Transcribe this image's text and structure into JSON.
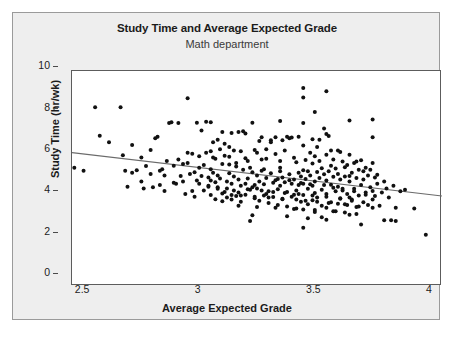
{
  "chart_data": {
    "type": "scatter",
    "title": "Study Time and Average Expected Grade",
    "subtitle": "Math department",
    "xlabel": "Average Expected Grade",
    "ylabel": "Study Time (hr/wk)",
    "xlim": [
      2.4,
      4.0
    ],
    "ylim": [
      0,
      10.4
    ],
    "xticks": [
      2.5,
      3,
      3.5,
      4
    ],
    "xticklabels": [
      "2.5",
      "3",
      "3.5",
      "4"
    ],
    "yticks": [
      0,
      2,
      4,
      6,
      8,
      10
    ],
    "yticklabels": [
      "0",
      "2",
      "4",
      "6",
      "8",
      "10"
    ],
    "grid": false,
    "legend": false,
    "marker_color": "#111111",
    "marker_size": 2.0,
    "trendline": {
      "label": "linear fit",
      "color": "#6b6b6b",
      "x": [
        2.4,
        4.0
      ],
      "y": [
        6.45,
        4.35
      ]
    },
    "points": [
      [
        2.41,
        5.72
      ],
      [
        2.45,
        5.58
      ],
      [
        2.5,
        8.65
      ],
      [
        2.52,
        7.27
      ],
      [
        2.56,
        6.95
      ],
      [
        2.61,
        8.65
      ],
      [
        2.62,
        6.33
      ],
      [
        2.63,
        5.58
      ],
      [
        2.64,
        4.8
      ],
      [
        2.66,
        6.82
      ],
      [
        2.68,
        5.6
      ],
      [
        2.7,
        5.05
      ],
      [
        2.71,
        4.72
      ],
      [
        2.72,
        5.8
      ],
      [
        2.74,
        6.58
      ],
      [
        2.75,
        4.78
      ],
      [
        2.76,
        7.15
      ],
      [
        2.77,
        7.22
      ],
      [
        2.78,
        5.58
      ],
      [
        2.79,
        5.65
      ],
      [
        2.8,
        4.6
      ],
      [
        2.81,
        6.05
      ],
      [
        2.82,
        7.88
      ],
      [
        2.83,
        7.92
      ],
      [
        2.84,
        5.0
      ],
      [
        2.85,
        4.95
      ],
      [
        2.86,
        7.88
      ],
      [
        2.87,
        5.32
      ],
      [
        2.88,
        5.05
      ],
      [
        2.89,
        4.45
      ],
      [
        2.9,
        9.08
      ],
      [
        2.9,
        6.45
      ],
      [
        2.91,
        5.42
      ],
      [
        2.92,
        6.4
      ],
      [
        2.93,
        4.32
      ],
      [
        2.93,
        5.5
      ],
      [
        2.94,
        7.9
      ],
      [
        2.94,
        5.1
      ],
      [
        2.95,
        4.95
      ],
      [
        2.95,
        5.72
      ],
      [
        2.96,
        7.52
      ],
      [
        2.96,
        5.32
      ],
      [
        2.97,
        4.62
      ],
      [
        2.97,
        5.85
      ],
      [
        2.98,
        7.95
      ],
      [
        2.98,
        6.45
      ],
      [
        2.99,
        5.25
      ],
      [
        2.99,
        4.8
      ],
      [
        3.0,
        7.92
      ],
      [
        3.0,
        6.52
      ],
      [
        3.0,
        5.65
      ],
      [
        3.0,
        5.1
      ],
      [
        3.0,
        4.4
      ],
      [
        3.01,
        6.95
      ],
      [
        3.01,
        5.48
      ],
      [
        3.02,
        6.15
      ],
      [
        3.02,
        4.2
      ],
      [
        3.03,
        5.35
      ],
      [
        3.03,
        4.7
      ],
      [
        3.04,
        6.62
      ],
      [
        3.04,
        5.2
      ],
      [
        3.05,
        4.1
      ],
      [
        3.05,
        5.9
      ],
      [
        3.06,
        6.3
      ],
      [
        3.06,
        4.55
      ],
      [
        3.07,
        5.05
      ],
      [
        3.07,
        4.28
      ],
      [
        3.08,
        6.72
      ],
      [
        3.08,
        5.45
      ],
      [
        3.09,
        4.95
      ],
      [
        3.09,
        4.18
      ],
      [
        3.1,
        6.55
      ],
      [
        3.1,
        5.3
      ],
      [
        3.1,
        4.62
      ],
      [
        3.11,
        5.95
      ],
      [
        3.11,
        4.35
      ],
      [
        3.12,
        7.45
      ],
      [
        3.12,
        5.15
      ],
      [
        3.13,
        4.85
      ],
      [
        3.13,
        4.08
      ],
      [
        3.14,
        7.48
      ],
      [
        3.14,
        5.62
      ],
      [
        3.15,
        4.95
      ],
      [
        3.15,
        4.42
      ],
      [
        3.16,
        6.05
      ],
      [
        3.16,
        5.2
      ],
      [
        3.17,
        4.65
      ],
      [
        3.17,
        3.15
      ],
      [
        3.18,
        7.9
      ],
      [
        3.18,
        5.5
      ],
      [
        3.19,
        4.88
      ],
      [
        3.19,
        4.25
      ],
      [
        3.2,
        6.45
      ],
      [
        3.2,
        5.35
      ],
      [
        3.2,
        4.72
      ],
      [
        3.21,
        5.05
      ],
      [
        3.21,
        4.12
      ],
      [
        3.22,
        7.2
      ],
      [
        3.22,
        5.58
      ],
      [
        3.23,
        4.92
      ],
      [
        3.23,
        4.38
      ],
      [
        3.24,
        6.15
      ],
      [
        3.24,
        5.22
      ],
      [
        3.25,
        4.58
      ],
      [
        3.25,
        4.02
      ],
      [
        3.26,
        7.05
      ],
      [
        3.26,
        5.45
      ],
      [
        3.27,
        5.0
      ],
      [
        3.27,
        4.3
      ],
      [
        3.28,
        6.38
      ],
      [
        3.28,
        5.12
      ],
      [
        3.29,
        4.68
      ],
      [
        3.29,
        3.92
      ],
      [
        3.3,
        7.98
      ],
      [
        3.3,
        5.55
      ],
      [
        3.3,
        4.85
      ],
      [
        3.31,
        5.25
      ],
      [
        3.31,
        4.2
      ],
      [
        3.32,
        6.55
      ],
      [
        3.32,
        5.02
      ],
      [
        3.33,
        4.55
      ],
      [
        3.33,
        3.85
      ],
      [
        3.34,
        7.15
      ],
      [
        3.34,
        5.4
      ],
      [
        3.35,
        4.95
      ],
      [
        3.35,
        4.32
      ],
      [
        3.36,
        6.2
      ],
      [
        3.36,
        5.15
      ],
      [
        3.37,
        4.62
      ],
      [
        3.37,
        3.75
      ],
      [
        3.38,
        7.22
      ],
      [
        3.38,
        5.48
      ],
      [
        3.38,
        4.88
      ],
      [
        3.39,
        5.3
      ],
      [
        3.39,
        4.08
      ],
      [
        3.4,
        9.58
      ],
      [
        3.4,
        9.12
      ],
      [
        3.4,
        7.88
      ],
      [
        3.4,
        6.8
      ],
      [
        3.4,
        5.6
      ],
      [
        3.4,
        4.95
      ],
      [
        3.4,
        4.4
      ],
      [
        3.4,
        3.7
      ],
      [
        3.4,
        2.82
      ],
      [
        3.41,
        6.1
      ],
      [
        3.41,
        5.18
      ],
      [
        3.42,
        4.7
      ],
      [
        3.42,
        3.95
      ],
      [
        3.43,
        6.45
      ],
      [
        3.43,
        5.35
      ],
      [
        3.44,
        4.85
      ],
      [
        3.44,
        4.15
      ],
      [
        3.45,
        8.42
      ],
      [
        3.45,
        6.28
      ],
      [
        3.45,
        5.05
      ],
      [
        3.45,
        4.5
      ],
      [
        3.45,
        3.58
      ],
      [
        3.46,
        5.52
      ],
      [
        3.46,
        4.28
      ],
      [
        3.47,
        6.05
      ],
      [
        3.47,
        5.22
      ],
      [
        3.48,
        4.65
      ],
      [
        3.48,
        3.88
      ],
      [
        3.49,
        7.62
      ],
      [
        3.49,
        5.4
      ],
      [
        3.5,
        9.42
      ],
      [
        3.5,
        7.35
      ],
      [
        3.5,
        6.35
      ],
      [
        3.5,
        5.1
      ],
      [
        3.5,
        4.45
      ],
      [
        3.5,
        3.78
      ],
      [
        3.5,
        3.2
      ],
      [
        3.51,
        7.25
      ],
      [
        3.51,
        5.55
      ],
      [
        3.52,
        4.9
      ],
      [
        3.52,
        4.05
      ],
      [
        3.53,
        6.12
      ],
      [
        3.53,
        5.28
      ],
      [
        3.54,
        4.58
      ],
      [
        3.54,
        3.62
      ],
      [
        3.55,
        6.55
      ],
      [
        3.55,
        5.42
      ],
      [
        3.55,
        4.8
      ],
      [
        3.56,
        5.15
      ],
      [
        3.56,
        4.22
      ],
      [
        3.57,
        6.02
      ],
      [
        3.57,
        4.62
      ],
      [
        3.58,
        5.3
      ],
      [
        3.58,
        3.95
      ],
      [
        3.59,
        5.85
      ],
      [
        3.59,
        4.45
      ],
      [
        3.6,
        8.0
      ],
      [
        3.6,
        6.35
      ],
      [
        3.6,
        5.05
      ],
      [
        3.6,
        4.28
      ],
      [
        3.6,
        3.45
      ],
      [
        3.61,
        5.48
      ],
      [
        3.61,
        4.12
      ],
      [
        3.62,
        5.95
      ],
      [
        3.62,
        4.7
      ],
      [
        3.63,
        5.22
      ],
      [
        3.63,
        3.82
      ],
      [
        3.64,
        5.62
      ],
      [
        3.64,
        4.38
      ],
      [
        3.65,
        6.08
      ],
      [
        3.65,
        4.88
      ],
      [
        3.65,
        2.98
      ],
      [
        3.66,
        5.15
      ],
      [
        3.66,
        4.05
      ],
      [
        3.67,
        5.72
      ],
      [
        3.67,
        4.52
      ],
      [
        3.68,
        5.35
      ],
      [
        3.68,
        3.92
      ],
      [
        3.69,
        4.78
      ],
      [
        3.7,
        8.05
      ],
      [
        3.7,
        7.2
      ],
      [
        3.7,
        5.95
      ],
      [
        3.7,
        4.6
      ],
      [
        3.7,
        4.18
      ],
      [
        3.7,
        3.78
      ],
      [
        3.71,
        5.25
      ],
      [
        3.71,
        4.35
      ],
      [
        3.72,
        4.95
      ],
      [
        3.73,
        3.88
      ],
      [
        3.74,
        4.52
      ],
      [
        3.75,
        5.05
      ],
      [
        3.75,
        3.18
      ],
      [
        3.76,
        4.72
      ],
      [
        3.77,
        4.28
      ],
      [
        3.78,
        3.18
      ],
      [
        3.79,
        4.85
      ],
      [
        3.8,
        3.78
      ],
      [
        3.8,
        3.15
      ],
      [
        3.82,
        4.58
      ],
      [
        3.84,
        4.65
      ],
      [
        3.88,
        3.75
      ],
      [
        3.93,
        2.48
      ],
      [
        2.88,
        5.9
      ],
      [
        2.92,
        4.6
      ],
      [
        3.02,
        5.02
      ],
      [
        3.06,
        6.88
      ],
      [
        3.12,
        4.52
      ],
      [
        3.18,
        4.78
      ],
      [
        3.24,
        4.45
      ],
      [
        3.3,
        5.72
      ],
      [
        3.36,
        4.42
      ],
      [
        3.42,
        5.55
      ],
      [
        3.48,
        5.7
      ],
      [
        3.54,
        5.68
      ],
      [
        3.6,
        5.32
      ],
      [
        3.66,
        5.55
      ],
      [
        3.33,
        7.22
      ],
      [
        3.35,
        7.18
      ],
      [
        3.28,
        7.2
      ],
      [
        3.26,
        6.95
      ],
      [
        3.15,
        7.38
      ],
      [
        3.21,
        7.02
      ],
      [
        3.44,
        7.1
      ],
      [
        3.47,
        7.08
      ],
      [
        3.52,
        6.55
      ],
      [
        3.08,
        5.88
      ],
      [
        3.11,
        5.78
      ],
      [
        3.17,
        5.72
      ],
      [
        3.23,
        5.65
      ],
      [
        3.29,
        5.18
      ],
      [
        3.34,
        5.12
      ],
      [
        3.39,
        4.98
      ],
      [
        3.43,
        4.92
      ],
      [
        3.49,
        4.88
      ],
      [
        3.53,
        4.75
      ],
      [
        3.57,
        4.7
      ],
      [
        3.62,
        4.58
      ],
      [
        3.67,
        4.42
      ],
      [
        3.05,
        4.48
      ],
      [
        3.09,
        4.4
      ],
      [
        3.13,
        4.38
      ],
      [
        3.19,
        4.32
      ],
      [
        3.25,
        4.28
      ],
      [
        3.31,
        4.22
      ],
      [
        3.37,
        4.18
      ],
      [
        3.41,
        4.12
      ],
      [
        3.46,
        4.08
      ],
      [
        3.51,
        4.02
      ],
      [
        3.55,
        3.98
      ],
      [
        3.59,
        3.92
      ],
      [
        3.64,
        3.85
      ],
      [
        2.99,
        4.85
      ],
      [
        3.03,
        4.78
      ],
      [
        3.07,
        4.72
      ],
      [
        3.16,
        4.68
      ],
      [
        3.22,
        4.62
      ],
      [
        3.27,
        4.55
      ],
      [
        3.32,
        4.5
      ],
      [
        3.38,
        4.45
      ],
      [
        3.44,
        4.38
      ],
      [
        3.5,
        4.32
      ],
      [
        3.56,
        4.25
      ],
      [
        3.61,
        4.18
      ],
      [
        3.12,
        3.88
      ],
      [
        3.2,
        3.82
      ],
      [
        3.28,
        3.78
      ],
      [
        3.36,
        3.72
      ],
      [
        3.45,
        3.68
      ],
      [
        3.53,
        3.62
      ],
      [
        3.58,
        3.55
      ],
      [
        3.63,
        3.48
      ],
      [
        3.18,
        3.42
      ],
      [
        3.33,
        3.38
      ],
      [
        3.48,
        3.32
      ],
      [
        3.42,
        3.28
      ],
      [
        3.08,
        6.25
      ],
      [
        3.15,
        6.18
      ],
      [
        3.22,
        6.12
      ],
      [
        3.3,
        6.05
      ],
      [
        3.37,
        5.98
      ],
      [
        3.44,
        5.92
      ],
      [
        3.52,
        5.82
      ],
      [
        3.58,
        5.75
      ],
      [
        2.95,
        6.28
      ],
      [
        3.01,
        6.22
      ],
      [
        2.86,
        6.12
      ],
      [
        2.9,
        5.95
      ],
      [
        2.84,
        5.82
      ],
      [
        2.8,
        5.35
      ],
      [
        2.78,
        4.88
      ],
      [
        2.74,
        5.42
      ],
      [
        2.7,
        6.22
      ],
      [
        2.66,
        5.48
      ],
      [
        3.05,
        7.45
      ],
      [
        3.09,
        7.4
      ],
      [
        3.03,
        7.08
      ],
      [
        3.31,
        7.05
      ],
      [
        3.46,
        6.72
      ],
      [
        3.24,
        6.62
      ],
      [
        3.19,
        6.58
      ],
      [
        3.13,
        6.52
      ],
      [
        3.56,
        6.48
      ],
      [
        3.63,
        6.02
      ],
      [
        3.69,
        5.62
      ],
      [
        3.72,
        5.38
      ]
    ]
  },
  "axes": {
    "y_ticks": [
      {
        "label": "10",
        "value": 10
      },
      {
        "label": "8",
        "value": 8
      },
      {
        "label": "6",
        "value": 6
      },
      {
        "label": "4",
        "value": 4
      },
      {
        "label": "2",
        "value": 2
      },
      {
        "label": "0",
        "value": 0
      }
    ],
    "x_ticks": [
      {
        "label": "2.5",
        "value": 2.5
      },
      {
        "label": "3",
        "value": 3
      },
      {
        "label": "3.5",
        "value": 3.5
      },
      {
        "label": "4",
        "value": 4
      }
    ]
  },
  "colors": {
    "panel_background": "#eeeeee",
    "plot_background": "#ffffff",
    "panel_border": "#9a9a9a",
    "plot_border": "#5c5c5c",
    "text": "#1b1b1b",
    "subtitle_text": "#3a3a3a",
    "marker": "#111111",
    "trendline": "#6b6b6b"
  }
}
